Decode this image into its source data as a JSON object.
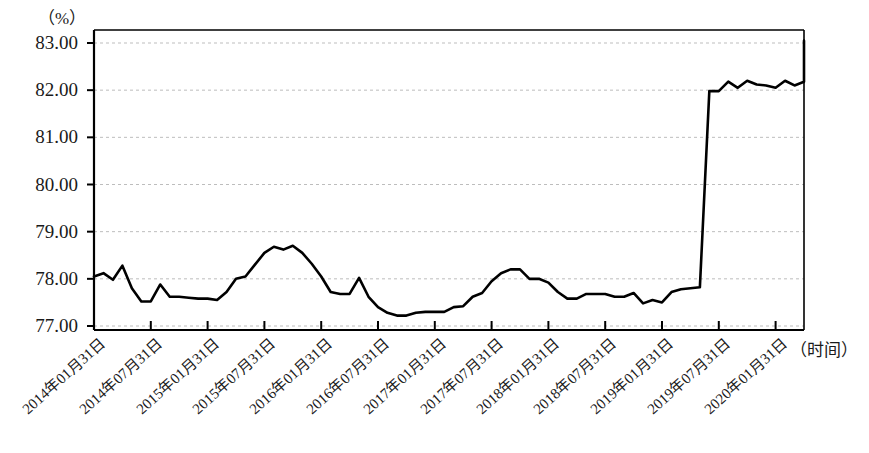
{
  "chart_data": {
    "type": "line",
    "title": "",
    "subtitle": "",
    "xlabel": "（时间）",
    "ylabel": "（%）",
    "ylim": [
      77.0,
      83.2
    ],
    "yticks": [
      83.0,
      82.0,
      81.0,
      80.0,
      79.0,
      78.0,
      77.0
    ],
    "ytick_labels": [
      "83.00",
      "82.00",
      "81.00",
      "80.00",
      "79.00",
      "78.00",
      "77.00"
    ],
    "grid": true,
    "grid_style": "dashed-horizontal",
    "legend": null,
    "legend_position": "none",
    "line_color": "#000000",
    "line_width": 2.6,
    "axis_color": "#000000",
    "grid_color": "#bdbdbd",
    "xtick_labels": [
      "2014年01月31日",
      "2014年07月31日",
      "2015年01月31日",
      "2015年07月31日",
      "2016年01月31日",
      "2016年07月31日",
      "2017年01月31日",
      "2017年07月31日",
      "2018年01月31日",
      "2018年07月31日",
      "2019年01月31日",
      "2019年07月31日",
      "2020年01月31日"
    ],
    "x": [
      "2014-01",
      "2014-02",
      "2014-03",
      "2014-04",
      "2014-05",
      "2014-06",
      "2014-07",
      "2014-08",
      "2014-09",
      "2014-10",
      "2014-11",
      "2014-12",
      "2015-01",
      "2015-02",
      "2015-03",
      "2015-04",
      "2015-05",
      "2015-06",
      "2015-07",
      "2015-08",
      "2015-09",
      "2015-10",
      "2015-11",
      "2015-12",
      "2016-01",
      "2016-02",
      "2016-03",
      "2016-04",
      "2016-05",
      "2016-06",
      "2016-07",
      "2016-08",
      "2016-09",
      "2016-10",
      "2016-11",
      "2016-12",
      "2017-01",
      "2017-02",
      "2017-03",
      "2017-04",
      "2017-05",
      "2017-06",
      "2017-07",
      "2017-08",
      "2017-09",
      "2017-10",
      "2017-11",
      "2017-12",
      "2018-01",
      "2018-02",
      "2018-03",
      "2018-04",
      "2018-05",
      "2018-06",
      "2018-07",
      "2018-08",
      "2018-09",
      "2018-10",
      "2018-11",
      "2018-12",
      "2019-01",
      "2019-02",
      "2019-03",
      "2019-04",
      "2019-05",
      "2019-06",
      "2019-07",
      "2019-08",
      "2019-09",
      "2019-10",
      "2019-11",
      "2019-12",
      "2020-01"
    ],
    "values": [
      78.05,
      78.12,
      77.98,
      78.28,
      77.8,
      77.52,
      77.52,
      77.88,
      77.62,
      77.62,
      77.6,
      77.58,
      77.58,
      77.55,
      77.72,
      78.0,
      78.05,
      78.3,
      78.55,
      78.68,
      78.62,
      78.7,
      78.55,
      78.32,
      78.05,
      77.72,
      77.68,
      77.68,
      78.02,
      77.62,
      77.4,
      77.28,
      77.22,
      77.22,
      77.28,
      77.3,
      77.3,
      77.3,
      77.4,
      77.42,
      77.62,
      77.7,
      77.95,
      78.12,
      78.2,
      78.2,
      78.0,
      78.0,
      77.92,
      77.72,
      77.58,
      77.58,
      77.68,
      77.68,
      77.68,
      77.62,
      77.62,
      77.7,
      77.48,
      77.55,
      77.5,
      77.72,
      77.78,
      77.8,
      77.82,
      81.98,
      81.98,
      82.18,
      82.05,
      82.2,
      82.12,
      82.1,
      82.05
    ],
    "series_name": "指标值",
    "annotations": [
      {
        "text": "2019年初出现阶跃上升",
        "visible": false
      }
    ],
    "tail_values": [
      82.2,
      82.1,
      82.18,
      82.3,
      82.25,
      82.6,
      82.42,
      83.05
    ]
  },
  "axis": {
    "y_unit_label": "（%）",
    "x_unit_label": "（时间）"
  }
}
